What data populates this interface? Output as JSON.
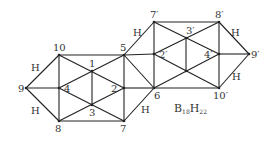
{
  "formula": {
    "base": "B",
    "n1": "18",
    "h": "H",
    "n2": "22",
    "x": 174,
    "y": 112
  },
  "nodes": [
    {
      "id": "10",
      "label": "10",
      "x": 59,
      "y": 55,
      "lx": 53,
      "ly": 51
    },
    {
      "id": "9",
      "label": "9",
      "x": 26,
      "y": 88,
      "lx": 18,
      "ly": 92
    },
    {
      "id": "8",
      "label": "8",
      "x": 59,
      "y": 121,
      "lx": 55,
      "ly": 132
    },
    {
      "id": "4",
      "label": "4",
      "x": 59,
      "y": 88,
      "lx": 64,
      "ly": 92
    },
    {
      "id": "1",
      "label": "1",
      "x": 92,
      "y": 71,
      "lx": 89,
      "ly": 67
    },
    {
      "id": "2",
      "label": "2",
      "x": 124,
      "y": 88,
      "lx": 111,
      "ly": 92
    },
    {
      "id": "3",
      "label": "3",
      "x": 92,
      "y": 105,
      "lx": 89,
      "ly": 116
    },
    {
      "id": "5",
      "label": "5",
      "x": 124,
      "y": 55,
      "lx": 120,
      "ly": 51
    },
    {
      "id": "7",
      "label": "7",
      "x": 124,
      "y": 121,
      "lx": 120,
      "ly": 132
    },
    {
      "id": "7p",
      "label": "7′",
      "x": 154,
      "y": 22,
      "lx": 150,
      "ly": 18
    },
    {
      "id": "8p",
      "label": "8′",
      "x": 219,
      "y": 22,
      "lx": 215,
      "ly": 18
    },
    {
      "id": "3p",
      "label": "3′",
      "x": 186,
      "y": 38,
      "lx": 186,
      "ly": 34
    },
    {
      "id": "2p",
      "label": "2′",
      "x": 154,
      "y": 54,
      "lx": 159,
      "ly": 58
    },
    {
      "id": "4p",
      "label": "4′",
      "x": 219,
      "y": 54,
      "lx": 204,
      "ly": 58
    },
    {
      "id": "9p",
      "label": "9′",
      "x": 249,
      "y": 54,
      "lx": 251,
      "ly": 58
    },
    {
      "id": "6",
      "label": "6",
      "x": 154,
      "y": 88,
      "lx": 154,
      "ly": 99
    },
    {
      "id": "c",
      "label": "",
      "x": 186,
      "y": 71,
      "lx": 0,
      "ly": 0
    },
    {
      "id": "10p",
      "label": "10′",
      "x": 219,
      "y": 88,
      "lx": 213,
      "ly": 99
    }
  ],
  "edges": [
    [
      "10",
      "5"
    ],
    [
      "10",
      "9"
    ],
    [
      "9",
      "8"
    ],
    [
      "8",
      "7"
    ],
    [
      "10",
      "8"
    ],
    [
      "9",
      "4"
    ],
    [
      "10",
      "2"
    ],
    [
      "4",
      "5"
    ],
    [
      "4",
      "7"
    ],
    [
      "8",
      "2"
    ],
    [
      "1",
      "3"
    ],
    [
      "5",
      "7"
    ],
    [
      "5",
      "7p"
    ],
    [
      "7",
      "6"
    ],
    [
      "5",
      "2p"
    ],
    [
      "2",
      "6"
    ],
    [
      "5",
      "6"
    ],
    [
      "7p",
      "6"
    ],
    [
      "7p",
      "8p"
    ],
    [
      "6",
      "10p"
    ],
    [
      "7p",
      "4p"
    ],
    [
      "2p",
      "8p"
    ],
    [
      "2p",
      "10p"
    ],
    [
      "6",
      "4p"
    ],
    [
      "3p",
      "c"
    ],
    [
      "8p",
      "10p"
    ],
    [
      "4p",
      "9p"
    ],
    [
      "8p",
      "9p"
    ],
    [
      "10p",
      "9p"
    ]
  ],
  "hydrogen_labels": [
    {
      "label": "H",
      "x": 31,
      "y": 71
    },
    {
      "label": "H",
      "x": 31,
      "y": 114
    },
    {
      "label": "H",
      "x": 133,
      "y": 36
    },
    {
      "label": "H",
      "x": 141,
      "y": 113
    },
    {
      "label": "H",
      "x": 231,
      "y": 36
    },
    {
      "label": "H",
      "x": 232,
      "y": 80
    }
  ]
}
